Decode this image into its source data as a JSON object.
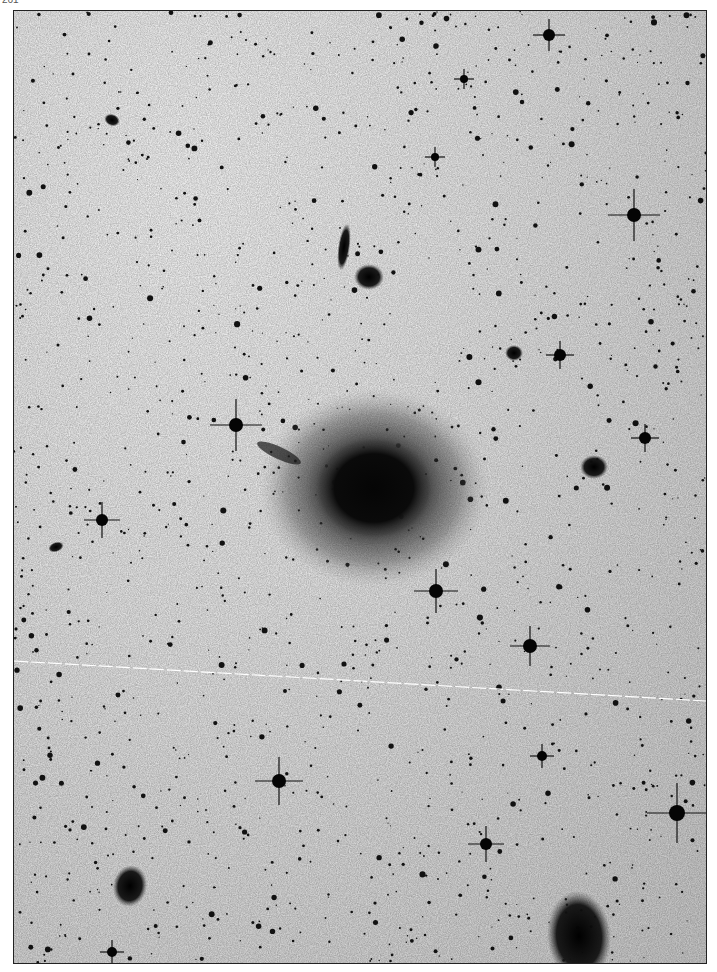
{
  "page": {
    "label": "261"
  },
  "plate": {
    "description": "Negative photographic plate of a star field with a large elliptical galaxy",
    "background_color": "#e2e2e2",
    "object_color": "#0a0a0a",
    "satellite_trail_color": "#ffffff",
    "main_galaxy": {
      "cx": 360,
      "cy": 477,
      "rx": 72,
      "ry": 62
    },
    "galaxies": [
      {
        "cx": 330,
        "cy": 236,
        "rx": 6,
        "ry": 24,
        "rot": 8
      },
      {
        "cx": 355,
        "cy": 266,
        "rx": 15,
        "ry": 13,
        "rot": 0
      },
      {
        "cx": 98,
        "cy": 109,
        "rx": 8,
        "ry": 6,
        "rot": 20
      },
      {
        "cx": 580,
        "cy": 456,
        "rx": 14,
        "ry": 12,
        "rot": 0
      },
      {
        "cx": 116,
        "cy": 875,
        "rx": 17,
        "ry": 21,
        "rot": 10
      },
      {
        "cx": 565,
        "cy": 925,
        "rx": 32,
        "ry": 45,
        "rot": -5
      },
      {
        "cx": 500,
        "cy": 342,
        "rx": 9,
        "ry": 8,
        "rot": 0
      },
      {
        "cx": 42,
        "cy": 536,
        "rx": 8,
        "ry": 5,
        "rot": -20
      }
    ],
    "bright_stars": [
      {
        "x": 535,
        "y": 24,
        "r": 6,
        "spike": 16
      },
      {
        "x": 620,
        "y": 204,
        "r": 7,
        "spike": 26
      },
      {
        "x": 222,
        "y": 414,
        "r": 7,
        "spike": 26
      },
      {
        "x": 88,
        "y": 509,
        "r": 6,
        "spike": 18
      },
      {
        "x": 422,
        "y": 580,
        "r": 7,
        "spike": 22
      },
      {
        "x": 516,
        "y": 635,
        "r": 7,
        "spike": 20
      },
      {
        "x": 265,
        "y": 770,
        "r": 7,
        "spike": 24
      },
      {
        "x": 472,
        "y": 833,
        "r": 6,
        "spike": 18
      },
      {
        "x": 663,
        "y": 802,
        "r": 8,
        "spike": 30
      },
      {
        "x": 546,
        "y": 344,
        "r": 6,
        "spike": 14
      },
      {
        "x": 631,
        "y": 427,
        "r": 6,
        "spike": 14
      },
      {
        "x": 450,
        "y": 68,
        "r": 4,
        "spike": 10
      },
      {
        "x": 421,
        "y": 146,
        "r": 4,
        "spike": 10
      },
      {
        "x": 98,
        "y": 941,
        "r": 5,
        "spike": 12
      },
      {
        "x": 528,
        "y": 745,
        "r": 5,
        "spike": 12
      }
    ],
    "satellite_trail": {
      "x1": 0,
      "y1": 650,
      "x2": 692,
      "y2": 690
    }
  }
}
